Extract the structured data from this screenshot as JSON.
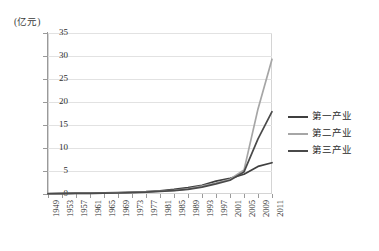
{
  "chart_data": {
    "type": "line",
    "title": "",
    "subtitle": "",
    "xlabel": "",
    "ylabel": "(亿元)",
    "ylim": [
      0,
      35
    ],
    "yticks": [
      0,
      5,
      10,
      15,
      20,
      25,
      30,
      35
    ],
    "grid": true,
    "legend_position": "right",
    "x_tick_labels": [
      "1949",
      "1953",
      "1957",
      "1961",
      "1965",
      "1969",
      "1973",
      "1977",
      "1981",
      "1985",
      "1989",
      "1993",
      "1997",
      "2001",
      "2005",
      "2009",
      "2011"
    ],
    "x": [
      1949,
      1953,
      1957,
      1961,
      1965,
      1969,
      1973,
      1977,
      1981,
      1985,
      1989,
      1993,
      1997,
      2001,
      2005,
      2009,
      2011
    ],
    "series": [
      {
        "name": "第一产业",
        "color": "#3f3f3f",
        "values": [
          0.1,
          0.15,
          0.2,
          0.2,
          0.25,
          0.3,
          0.4,
          0.5,
          0.7,
          1.0,
          1.4,
          1.9,
          2.8,
          3.4,
          4.3,
          6.0,
          6.8
        ]
      },
      {
        "name": "第二产业",
        "color": "#a6a6a6",
        "values": [
          0.05,
          0.1,
          0.15,
          0.15,
          0.2,
          0.25,
          0.35,
          0.45,
          0.6,
          0.8,
          1.1,
          1.7,
          2.4,
          3.2,
          5.2,
          18.5,
          29.3
        ]
      },
      {
        "name": "第三产业",
        "color": "#4a4a4a",
        "values": [
          0.05,
          0.08,
          0.12,
          0.12,
          0.18,
          0.22,
          0.3,
          0.4,
          0.55,
          0.75,
          1.0,
          1.5,
          2.2,
          3.0,
          4.8,
          12.0,
          17.9
        ]
      }
    ]
  },
  "legend": {
    "items": [
      {
        "label": "第一产业"
      },
      {
        "label": "第二产业"
      },
      {
        "label": "第三产业"
      }
    ]
  },
  "axis": {
    "unit_label": "(亿元)"
  }
}
